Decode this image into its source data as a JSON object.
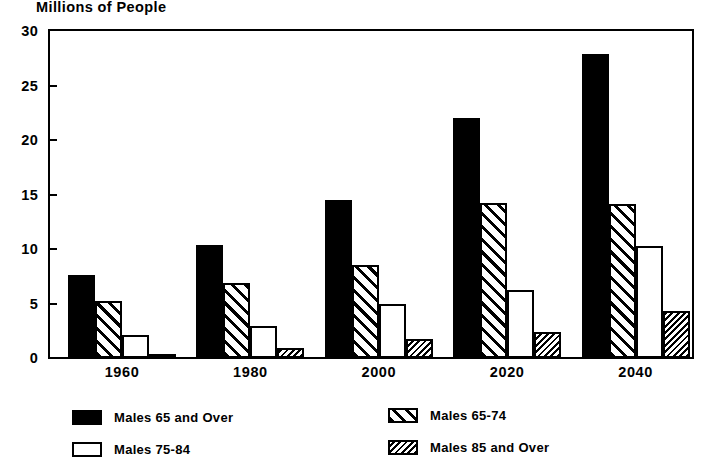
{
  "chart_data": {
    "type": "bar",
    "title": "Millions of People",
    "xlabel": "",
    "ylabel": "Millions of People",
    "categories": [
      "1960",
      "1980",
      "2000",
      "2020",
      "2040"
    ],
    "ylim": [
      0,
      30
    ],
    "yticks": [
      0,
      5,
      10,
      15,
      20,
      25,
      30
    ],
    "ytick_labels": [
      "0",
      "5",
      "10",
      "15",
      "20",
      "25",
      "30"
    ],
    "grid": false,
    "legend_position": "below-plot-two-columns",
    "series": [
      {
        "name": "Males 65 and Over",
        "pattern": "solid-black",
        "values": [
          7.6,
          10.4,
          14.5,
          22.0,
          27.9
        ]
      },
      {
        "name": "Males 65-74",
        "pattern": "diagonal-hatch",
        "values": [
          5.2,
          6.9,
          8.5,
          14.2,
          14.1
        ]
      },
      {
        "name": "Males 75-84",
        "pattern": "open-white",
        "values": [
          2.1,
          2.9,
          5.0,
          6.2,
          10.3
        ]
      },
      {
        "name": "Males 85 and Over",
        "pattern": "dense-back-hatch",
        "values": [
          0.4,
          0.9,
          1.7,
          2.4,
          4.3
        ]
      }
    ]
  },
  "legend": {
    "entries": [
      {
        "label": "Males 65 and Over",
        "pattern": "solid-black"
      },
      {
        "label": "Males 65-74",
        "pattern": "diagonal-hatch"
      },
      {
        "label": "Males 75-84",
        "pattern": "open-white"
      },
      {
        "label": "Males 85 and Over",
        "pattern": "dense-back-hatch"
      }
    ]
  },
  "colors": {
    "ink": "#000000",
    "paper": "#ffffff"
  }
}
